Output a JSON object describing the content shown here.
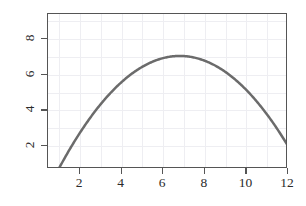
{
  "chart_data": {
    "type": "line",
    "title": "",
    "subtitle": "",
    "xlabel": "",
    "ylabel": "",
    "xlim": [
      0.55,
      12.0
    ],
    "ylim": [
      1.2,
      9.5
    ],
    "grid": true,
    "legend": null,
    "curve_color": "#6b6b6b",
    "axis_color": "#555555",
    "grid_color": "#eeeef2",
    "background": "#ffffff",
    "line_width": 2.5,
    "equation": "y = -0.187*(x - 6.8)^2 + 7.05",
    "vertex": {
      "x": 6.8,
      "y": 7.05
    },
    "xticks": [
      2,
      4,
      6,
      8,
      10,
      12
    ],
    "xtick_labels": [
      "2",
      "4",
      "6",
      "8",
      "10",
      "12"
    ],
    "yticks": [
      2,
      4,
      6,
      8
    ],
    "ytick_labels": [
      "2",
      "4",
      "6",
      "8"
    ],
    "ytick_rotation_deg": -90,
    "x": [
      1.0,
      1.5,
      2.0,
      2.5,
      3.0,
      3.5,
      4.0,
      4.5,
      5.0,
      5.5,
      6.0,
      6.5,
      7.0,
      7.5,
      8.0,
      8.5,
      9.0,
      9.5,
      10.0,
      10.5,
      11.0,
      11.5,
      12.0
    ],
    "values": [
      1.33,
      2.14,
      2.87,
      3.53,
      4.11,
      4.62,
      5.05,
      5.41,
      5.7,
      5.92,
      6.06,
      6.13,
      6.13,
      6.06,
      5.92,
      5.7,
      5.41,
      5.05,
      4.62,
      4.11,
      3.53,
      2.87,
      2.14
    ],
    "series": [
      {
        "name": "curve",
        "color": "#6b6b6b",
        "x": [
          1.0,
          1.5,
          2.0,
          2.5,
          3.0,
          3.5,
          4.0,
          4.5,
          5.0,
          5.5,
          6.0,
          6.5,
          6.8,
          7.0,
          7.5,
          8.0,
          8.5,
          9.0,
          9.5,
          10.0,
          10.5,
          11.0,
          11.5,
          12.0
        ],
        "y": [
          1.33,
          2.35,
          3.27,
          4.09,
          4.82,
          5.46,
          6.0,
          6.45,
          6.8,
          7.0,
          7.17,
          7.03,
          7.05,
          7.04,
          6.93,
          6.78,
          6.48,
          6.08,
          5.59,
          5.0,
          4.32,
          3.54,
          2.66,
          2.0
        ]
      }
    ],
    "plot_box": {
      "left": 47,
      "top": 13,
      "width": 240,
      "height": 155
    }
  },
  "axes": {
    "x_tick_labels": [
      "2",
      "4",
      "6",
      "8",
      "10",
      "12"
    ],
    "y_tick_labels": [
      "8",
      "6",
      "4",
      "2"
    ]
  }
}
